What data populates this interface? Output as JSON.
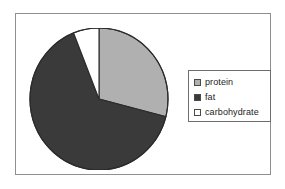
{
  "chart_data": {
    "type": "pie",
    "title": "",
    "categories": [
      "protein",
      "fat",
      "carbohydrate"
    ],
    "values": [
      29,
      65,
      6
    ],
    "unit": "percent",
    "start_angle_deg": 0,
    "direction": "clockwise",
    "colors": [
      "#b0b0b0",
      "#3a3a3a",
      "#ffffff"
    ],
    "edge_color": "#2b2b2b",
    "legend": {
      "position": "right",
      "entries": [
        {
          "label": "protein",
          "color": "#b0b0b0",
          "swatch": "legend-swatch-protein"
        },
        {
          "label": "fat",
          "color": "#3a3a3a",
          "swatch": "legend-swatch-fat"
        },
        {
          "label": "carbohydrate",
          "color": "#ffffff",
          "swatch": "legend-swatch-carbohydrate"
        }
      ]
    },
    "grid": false,
    "xlabel": "",
    "ylabel": ""
  },
  "figure": {
    "frame_color": "#8f8f8f",
    "background": "#ffffff"
  },
  "legend": {
    "entries": [
      {
        "label": "protein"
      },
      {
        "label": "fat"
      },
      {
        "label": "carbohydrate"
      }
    ]
  }
}
